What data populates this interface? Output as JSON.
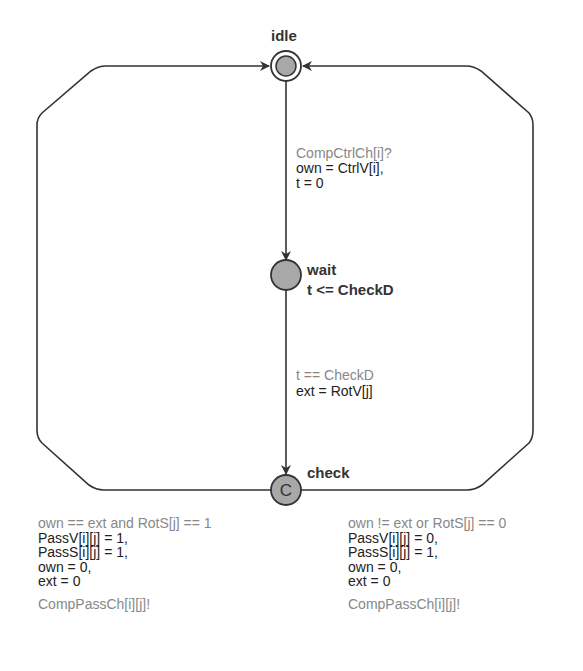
{
  "diagram": {
    "type": "timed-automaton",
    "locations": [
      {
        "id": "idle",
        "name": "idle",
        "initial": true,
        "invariant": ""
      },
      {
        "id": "wait",
        "name": "wait",
        "invariant": "t <= CheckD"
      },
      {
        "id": "check",
        "name": "check",
        "committed": true,
        "committed_marker": "C"
      }
    ],
    "edges": {
      "idle_to_wait": {
        "sync": "CompCtrlCh[i]?",
        "updates": [
          "own = CtrlV[i],",
          "t = 0"
        ]
      },
      "wait_to_check": {
        "guard": "t == CheckD",
        "updates": [
          "ext = RotV[j]"
        ]
      },
      "check_to_idle_left": {
        "guard": "own == ext and RotS[j] == 1",
        "updates": [
          "PassV[i][j] = 1,",
          "PassS[i][j] = 1,",
          "own = 0,",
          "ext = 0"
        ],
        "sync": "CompPassCh[i][j]!"
      },
      "check_to_idle_right": {
        "guard": "own != ext or RotS[j] == 0",
        "updates": [
          "PassV[i][j] = 0,",
          "PassS[i][j] = 1,",
          "own = 0,",
          "ext = 0"
        ],
        "sync": "CompPassCh[i][j]!"
      }
    },
    "colors": {
      "line": "#333333",
      "node_fill": "#a8a8a8",
      "label_gray": "#888888",
      "label_dark": "#222222"
    }
  }
}
